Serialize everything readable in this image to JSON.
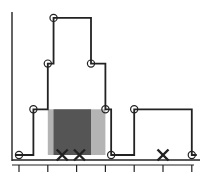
{
  "chart_data": {
    "type": "line",
    "subtype": "step",
    "title": "",
    "xlabel": "",
    "ylabel": "",
    "grid": false,
    "legend": null,
    "tick_labels": [],
    "x_ticks": [
      0,
      1,
      2,
      3,
      4,
      5,
      6
    ],
    "ylim": [
      0,
      3
    ],
    "step_points": [
      {
        "x": 0.0,
        "y": 0
      },
      {
        "x": 0.5,
        "y": 1
      },
      {
        "x": 1.0,
        "y": 2
      },
      {
        "x": 1.2,
        "y": 3
      },
      {
        "x": 2.5,
        "y": 2
      },
      {
        "x": 3.0,
        "y": 1
      },
      {
        "x": 3.2,
        "y": 0
      },
      {
        "x": 4.0,
        "y": 1
      },
      {
        "x": 6.0,
        "y": 0
      }
    ],
    "cross_markers_x": [
      1.5,
      2.1,
      5.0
    ],
    "shaded_regions": [
      {
        "x_start": 1.0,
        "x_end": 3.0,
        "y_top": 1,
        "shade": "light"
      },
      {
        "x_start": 1.2,
        "x_end": 2.5,
        "y_top": 1,
        "shade": "dark"
      }
    ]
  },
  "colors": {
    "line": "#222222",
    "axis": "#222222",
    "shade_light": "#b4b4b4",
    "shade_dark": "#555555",
    "marker_fill": "#ffffff"
  }
}
